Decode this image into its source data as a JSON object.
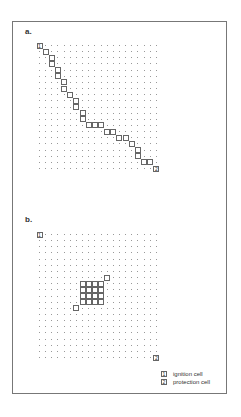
{
  "panels": [
    {
      "label": "a.",
      "grid": {
        "cols": 20,
        "rows": 21
      },
      "ignition_cell": {
        "col": 0,
        "row": 0,
        "text": "1"
      },
      "protection_cell": {
        "col": 19,
        "row": 20,
        "text": "2"
      },
      "path_cells": [
        [
          1,
          1
        ],
        [
          2,
          2
        ],
        [
          2,
          3
        ],
        [
          3,
          4
        ],
        [
          3,
          5
        ],
        [
          4,
          6
        ],
        [
          4,
          7
        ],
        [
          5,
          8
        ],
        [
          6,
          9
        ],
        [
          6,
          10
        ],
        [
          7,
          11
        ],
        [
          7,
          12
        ],
        [
          8,
          13
        ],
        [
          9,
          13
        ],
        [
          10,
          13
        ],
        [
          11,
          14
        ],
        [
          12,
          14
        ],
        [
          13,
          15
        ],
        [
          14,
          15
        ],
        [
          15,
          16
        ],
        [
          16,
          17
        ],
        [
          16,
          18
        ],
        [
          17,
          19
        ],
        [
          18,
          19
        ]
      ]
    },
    {
      "label": "b.",
      "grid": {
        "cols": 20,
        "rows": 21
      },
      "ignition_cell": {
        "col": 0,
        "row": 0,
        "text": "1"
      },
      "protection_cell": {
        "col": 19,
        "row": 20,
        "text": "2"
      },
      "block_cells": [
        [
          7,
          8
        ],
        [
          8,
          8
        ],
        [
          9,
          8
        ],
        [
          10,
          8
        ],
        [
          7,
          9
        ],
        [
          8,
          9
        ],
        [
          9,
          9
        ],
        [
          10,
          9
        ],
        [
          7,
          10
        ],
        [
          8,
          10
        ],
        [
          9,
          10
        ],
        [
          10,
          10
        ],
        [
          7,
          11
        ],
        [
          8,
          11
        ],
        [
          9,
          11
        ],
        [
          10,
          11
        ],
        [
          11,
          7
        ],
        [
          6,
          12
        ]
      ]
    }
  ],
  "legend": {
    "items": [
      {
        "symbol": "1",
        "label": "ignition cell"
      },
      {
        "symbol": "2",
        "label": "protection cell"
      }
    ]
  }
}
